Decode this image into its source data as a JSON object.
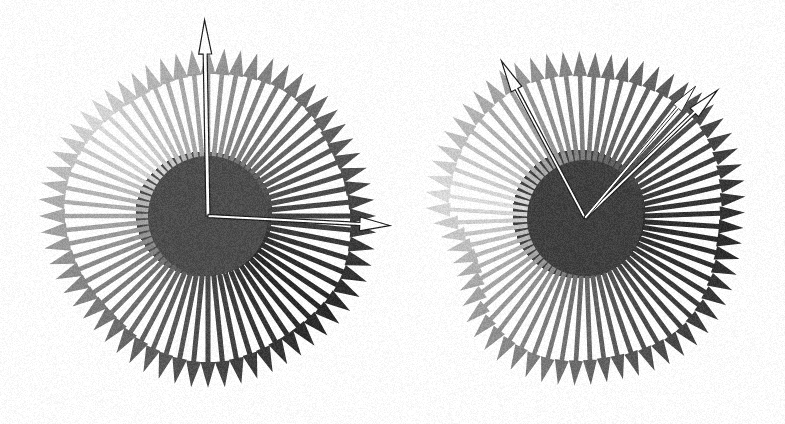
{
  "figure": {
    "type": "radial-arrow-glyph-pair",
    "width": 785,
    "height": 424,
    "background_color": "#ffffff",
    "noise": {
      "enabled": true,
      "strength": 0.1,
      "description": "low-level scanned-paper grain over the whole image"
    }
  },
  "chart_data": {
    "type": "scatter",
    "title": "",
    "subtitle": "",
    "xlabel": "",
    "ylabel": "",
    "grid": false,
    "legend": false,
    "panels": [
      {
        "name": "left-glyph",
        "label": "",
        "center_x": 208,
        "center_y": 216,
        "core_radius_x": 68,
        "core_radius_y": 62,
        "core_offset_x": -4,
        "core_offset_y": -2,
        "arrow_count": 64,
        "angle_start_deg": 0,
        "angle_step_deg": 5.625,
        "radius_inner": 60,
        "radius_outer_mean": 168,
        "radius_outer_jitter": 10,
        "shaft_width": 5.2,
        "head_length": 26,
        "head_width": 15,
        "shade": {
          "dark_color": "#2b2b2b",
          "light_color": "#d8d8d8",
          "dark_angle_deg": 140,
          "light_angle_deg": 320,
          "core_dark_color": "#3c3c3c",
          "core_light_color": "#c6c6c6"
        },
        "radius_profile": [
          168,
          167,
          166,
          166,
          165,
          165,
          166,
          168,
          170,
          171,
          172,
          172,
          171,
          170,
          169,
          168,
          168,
          167,
          166,
          165,
          164,
          163,
          163,
          164,
          165,
          166,
          167,
          168,
          169,
          170,
          170,
          170,
          169,
          168,
          167,
          166,
          165,
          164,
          163,
          162,
          162,
          163,
          165,
          167,
          169,
          170,
          171,
          172,
          172,
          172,
          171,
          170,
          169,
          168,
          168,
          168,
          169,
          170,
          171,
          172,
          172,
          171,
          170,
          169
        ],
        "highlight_arrows": [
          {
            "name": "vertical-highlight-arrow",
            "angle_deg": 91,
            "length": 196,
            "inner_radius": 0,
            "shaft_width": 4.0,
            "head_length": 34,
            "head_width": 13,
            "fill": "#ffffff",
            "stroke": "#1e1e1e",
            "stroke_width": 1.2
          },
          {
            "name": "horizontal-highlight-arrow",
            "angle_deg": 357,
            "length": 182,
            "inner_radius": 0,
            "shaft_width": 3.2,
            "head_length": 30,
            "head_width": 14,
            "fill": "#ffffff",
            "stroke": "#1e1e1e",
            "stroke_width": 1.2
          }
        ]
      },
      {
        "name": "right-glyph",
        "label": "",
        "center_x": 585,
        "center_y": 218,
        "core_radius_x": 66,
        "core_radius_y": 64,
        "core_offset_x": -6,
        "core_offset_y": -4,
        "arrow_count": 64,
        "angle_start_deg": 2,
        "angle_step_deg": 5.625,
        "radius_inner": 58,
        "radius_outer_mean": 166,
        "radius_outer_jitter": 10,
        "shaft_width": 5.0,
        "head_length": 25,
        "head_width": 14,
        "shade": {
          "dark_color": "#2d2d2d",
          "light_color": "#dcdcdc",
          "dark_angle_deg": 170,
          "light_angle_deg": 350,
          "core_dark_color": "#3e3e3e",
          "core_light_color": "#c9c9c9"
        },
        "radius_profile": [
          160,
          162,
          164,
          166,
          168,
          170,
          171,
          172,
          172,
          171,
          170,
          169,
          168,
          167,
          166,
          166,
          167,
          168,
          169,
          170,
          171,
          171,
          170,
          169,
          168,
          167,
          166,
          165,
          164,
          163,
          162,
          160,
          152,
          146,
          142,
          140,
          141,
          145,
          151,
          158,
          163,
          166,
          168,
          169,
          170,
          170,
          169,
          168,
          167,
          166,
          166,
          167,
          168,
          169,
          170,
          170,
          169,
          168,
          166,
          164,
          162,
          160,
          159,
          159
        ],
        "highlight_arrows": [
          {
            "name": "upper-left-highlight-arrow",
            "angle_deg": 118,
            "length": 178,
            "inner_radius": 0,
            "shaft_width": 3.0,
            "head_length": 32,
            "head_width": 12,
            "fill": "#ffffff",
            "stroke": "#1e1e1e",
            "stroke_width": 1.2
          },
          {
            "name": "upper-right-highlight-arrow",
            "angle_deg": 44,
            "length": 184,
            "inner_radius": 0,
            "shaft_width": 3.0,
            "head_length": 32,
            "head_width": 12,
            "fill": "#ffffff",
            "stroke": "#1e1e1e",
            "stroke_width": 1.2
          },
          {
            "name": "upper-right-secondary-highlight-arrow",
            "angle_deg": 50,
            "length": 172,
            "inner_radius": 0,
            "shaft_width": 2.6,
            "head_length": 28,
            "head_width": 11,
            "fill": "#ffffff",
            "stroke": "#2a2a2a",
            "stroke_width": 1.0
          }
        ]
      }
    ]
  },
  "colors": {
    "background": "#ffffff",
    "arrow_darkest": "#2b2b2b",
    "arrow_lightest": "#dcdcdc",
    "highlight_fill": "#ffffff",
    "highlight_stroke": "#1e1e1e"
  }
}
